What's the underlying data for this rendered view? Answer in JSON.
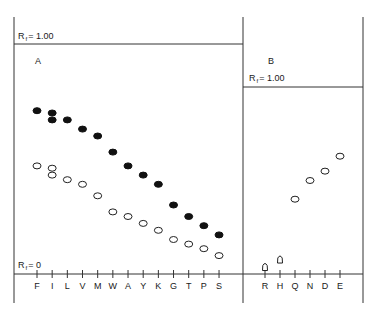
{
  "chart_data": [
    {
      "type": "scatter",
      "panel_label": "A",
      "top_label": {
        "main": "R",
        "sub": "f",
        "rest": "= 1.00"
      },
      "bottom_label": {
        "main": "R",
        "sub": "f",
        "rest": "= 0"
      },
      "ylabel": "Rf",
      "ylim": [
        0,
        1.0
      ],
      "categories": [
        "F",
        "I",
        "L",
        "V",
        "M",
        "W",
        "A",
        "Y",
        "K",
        "G",
        "T",
        "P",
        "S"
      ],
      "series": [
        {
          "name": "filled",
          "marker": "filled-circle",
          "points": [
            {
              "x": "F",
              "y": 0.71
            },
            {
              "x": "I",
              "y": 0.7
            },
            {
              "x": "I",
              "y": 0.67
            },
            {
              "x": "L",
              "y": 0.67
            },
            {
              "x": "V",
              "y": 0.63
            },
            {
              "x": "M",
              "y": 0.6
            },
            {
              "x": "W",
              "y": 0.53
            },
            {
              "x": "A",
              "y": 0.47
            },
            {
              "x": "Y",
              "y": 0.43
            },
            {
              "x": "K",
              "y": 0.39
            },
            {
              "x": "G",
              "y": 0.3
            },
            {
              "x": "T",
              "y": 0.25
            },
            {
              "x": "P",
              "y": 0.21
            },
            {
              "x": "S",
              "y": 0.17
            }
          ]
        },
        {
          "name": "open",
          "marker": "open-circle",
          "points": [
            {
              "x": "F",
              "y": 0.47
            },
            {
              "x": "I",
              "y": 0.46
            },
            {
              "x": "I",
              "y": 0.43
            },
            {
              "x": "L",
              "y": 0.41
            },
            {
              "x": "V",
              "y": 0.39
            },
            {
              "x": "M",
              "y": 0.34
            },
            {
              "x": "W",
              "y": 0.27
            },
            {
              "x": "A",
              "y": 0.25
            },
            {
              "x": "Y",
              "y": 0.22
            },
            {
              "x": "K",
              "y": 0.19
            },
            {
              "x": "G",
              "y": 0.15
            },
            {
              "x": "T",
              "y": 0.13
            },
            {
              "x": "P",
              "y": 0.11
            },
            {
              "x": "S",
              "y": 0.08
            }
          ]
        }
      ],
      "grid": false,
      "legend": "none"
    },
    {
      "type": "scatter",
      "panel_label": "B",
      "top_label": {
        "main": "R",
        "sub": "f",
        "rest": "= 1.00"
      },
      "ylabel": "Rf",
      "ylim": [
        0,
        1.0
      ],
      "categories": [
        "R",
        "H",
        "Q",
        "N",
        "D",
        "E"
      ],
      "series": [
        {
          "name": "open",
          "marker": "open-circle",
          "points": [
            {
              "x": "Q",
              "y": 0.4
            },
            {
              "x": "N",
              "y": 0.5
            },
            {
              "x": "D",
              "y": 0.55
            },
            {
              "x": "E",
              "y": 0.63
            }
          ]
        },
        {
          "name": "triangle",
          "marker": "open-triangle",
          "points": [
            {
              "x": "R",
              "y": 0.04
            },
            {
              "x": "H",
              "y": 0.08
            }
          ]
        }
      ],
      "grid": false,
      "legend": "none"
    }
  ]
}
